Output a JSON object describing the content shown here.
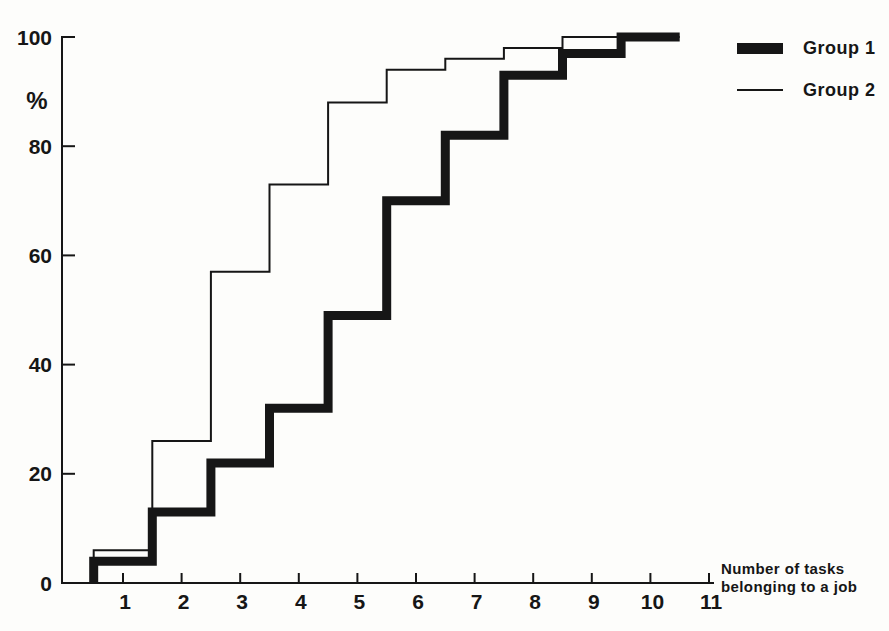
{
  "figure": {
    "background": "#fdfdfb",
    "ink": "#161616"
  },
  "chart_data": {
    "type": "line",
    "variant": "cumulative-step-frequency-polygon",
    "title": "",
    "ylabel": "%",
    "xlabel_lines": [
      "Number of tasks",
      "belonging to a job"
    ],
    "x_ticks": [
      "1",
      "2",
      "3",
      "4",
      "5",
      "6",
      "7",
      "8",
      "9",
      "10",
      "11"
    ],
    "y_ticks": [
      100,
      80,
      60,
      40,
      20,
      0
    ],
    "xlim": [
      0.5,
      11
    ],
    "ylim": [
      0,
      100
    ],
    "grid": false,
    "legend_position": "top-right",
    "step_note": "Each step spans x-0.5 to x+0.5; both curves rise from 0% at x=0.5",
    "line_end_x": 10.5,
    "series": [
      {
        "name": "Group 1",
        "style": "thick",
        "stroke_width": 9,
        "x": [
          1,
          2,
          3,
          4,
          5,
          6,
          7,
          8,
          9,
          10
        ],
        "cumulative_percent": [
          4,
          13,
          22,
          32,
          49,
          70,
          82,
          93,
          97,
          100
        ]
      },
      {
        "name": "Group 2",
        "style": "thin",
        "stroke_width": 2,
        "x": [
          1,
          2,
          3,
          4,
          5,
          6,
          7,
          8,
          9
        ],
        "cumulative_percent": [
          6,
          26,
          57,
          73,
          88,
          94,
          96,
          98,
          100
        ]
      }
    ]
  }
}
